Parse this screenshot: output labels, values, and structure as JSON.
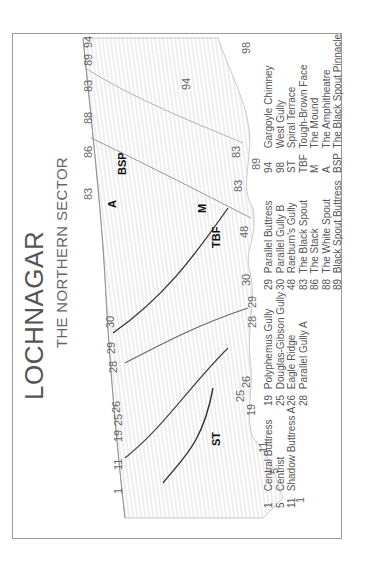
{
  "title": "LOCHNAGAR",
  "subtitle": "THE NORTHERN SECTOR",
  "colors": {
    "frame": "#9a9a9a",
    "rock_shading": "#c8c8c8",
    "line": "#333333",
    "text": "#555555"
  },
  "map_labels": {
    "crest": [
      "1",
      "11",
      "19",
      "25",
      "26",
      "28",
      "29",
      "30",
      "83",
      "86",
      "88",
      "83",
      "89",
      "94"
    ],
    "base": [
      "1",
      "5",
      "11",
      "19",
      "25",
      "26",
      "28",
      "29",
      "30",
      "48",
      "83",
      "89",
      "83",
      "94",
      "98"
    ],
    "features": [
      "ST",
      "TBF",
      "M",
      "A",
      "BSP"
    ]
  },
  "legend": {
    "col1": [
      {
        "key": "1",
        "label": "Central Buttress"
      },
      {
        "key": "5",
        "label": "Centrist"
      },
      {
        "key": "11",
        "label": "Shadow Buttress A"
      }
    ],
    "col2": [
      {
        "key": "19",
        "label": "Polyphemus Gully"
      },
      {
        "key": "25",
        "label": "Douglas-Gibson Gully"
      },
      {
        "key": "26",
        "label": "Eagle Ridge"
      },
      {
        "key": "28",
        "label": "Parallel Gully A"
      }
    ],
    "col3": [
      {
        "key": "29",
        "label": "Parallel Buttress"
      },
      {
        "key": "30",
        "label": "Parallel Gully B"
      },
      {
        "key": "48",
        "label": "Raeburn's Gully"
      },
      {
        "key": "83",
        "label": "The Black Spout"
      },
      {
        "key": "86",
        "label": "The Stack"
      },
      {
        "key": "88",
        "label": "The White Spout"
      },
      {
        "key": "89",
        "label": "Black Spout Buttress"
      }
    ],
    "col4": [
      {
        "key": "94",
        "label": "Gargoyle Chimney"
      },
      {
        "key": "98",
        "label": "West Gully"
      },
      {
        "key": "ST",
        "label": "Spiral Terrace"
      },
      {
        "key": "TBF",
        "label": "Tough-Brown Face"
      },
      {
        "key": "M",
        "label": "The Mound"
      },
      {
        "key": "A",
        "label": "The Amphitheatre"
      },
      {
        "key": "BSP",
        "label": "The Black Spout Pinnacle"
      }
    ]
  }
}
